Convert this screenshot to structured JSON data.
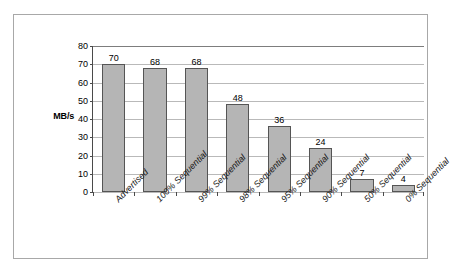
{
  "chart_data": {
    "type": "bar",
    "title": "",
    "xlabel": "",
    "ylabel": "MB/s",
    "ylim": [
      0,
      80
    ],
    "ytick_step": 10,
    "yticks": [
      80,
      70,
      60,
      50,
      40,
      30,
      20,
      10,
      0
    ],
    "grid": true,
    "legend": false,
    "categories": [
      "Advertised",
      "100% Sequential",
      "99% Sequential",
      "98% Sequential",
      "95% Sequential",
      "90% Sequential",
      "50% Sequential",
      "0% Sequential"
    ],
    "values": [
      70,
      68,
      68,
      48,
      36,
      24,
      7,
      4
    ],
    "data_labels": [
      "70",
      "68",
      "68",
      "48",
      "36",
      "24",
      "7",
      "4"
    ],
    "colors": {
      "bar_fill": "#b5b5b5",
      "bar_border": "#555555",
      "gridline": "#b9b9b9",
      "axis": "#4a4a4a",
      "frame": "#a8a8a8",
      "text": "#000000",
      "background": "#ffffff"
    }
  }
}
